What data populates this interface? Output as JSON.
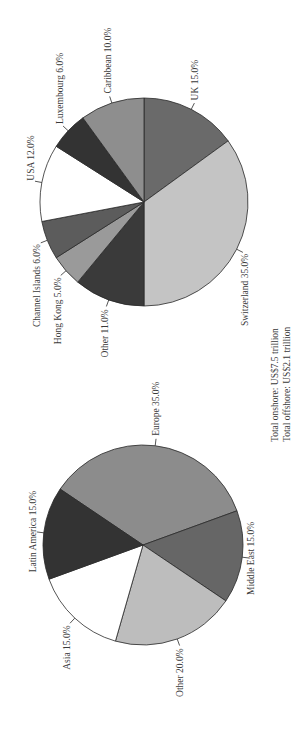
{
  "chart_data": [
    {
      "type": "pie",
      "title": "Offshore wealth by booking centre",
      "labels": [
        "UK",
        "Switzerland",
        "Other",
        "Hong Kong",
        "Channel Islands",
        "USA",
        "Luxembourg",
        "Caribbean"
      ],
      "values": [
        15.0,
        35.0,
        11.0,
        5.0,
        6.0,
        12.0,
        6.0,
        10.0
      ],
      "label_text": [
        "UK 15.0%",
        "Switzerland 35.0%",
        "Other 11.0%",
        "Hong Kong 5.0%",
        "Channel Islands 6.0%",
        "USA 12.0%",
        "Luxembourg 6.0%",
        "Caribbean 10.0%"
      ],
      "colors": [
        "#6a6a6a",
        "#c4c4c4",
        "#3a3a3a",
        "#9a9a9a",
        "#5c5c5c",
        "#ffffff",
        "#333333",
        "#8e8e8e"
      ],
      "unit": "%"
    },
    {
      "type": "pie",
      "title": "Onshore wealth by region",
      "labels": [
        "Europe",
        "Middle East",
        "Other",
        "Asia",
        "Latin America"
      ],
      "values": [
        35.0,
        15.0,
        20.0,
        15.0,
        15.0
      ],
      "label_text": [
        "Europe 35.0%",
        "Middle East 15.0%",
        "Other 20.0%",
        "Asia 15.0%",
        "Latin America 15.0%"
      ],
      "colors": [
        "#8c8c8c",
        "#666666",
        "#bdbdbd",
        "#ffffff",
        "#333333"
      ],
      "unit": "%"
    }
  ],
  "totals": {
    "onshore": "Total onshore: US$7.5 trillion",
    "offshore": "Total offshore: US$2.1 trillion"
  }
}
